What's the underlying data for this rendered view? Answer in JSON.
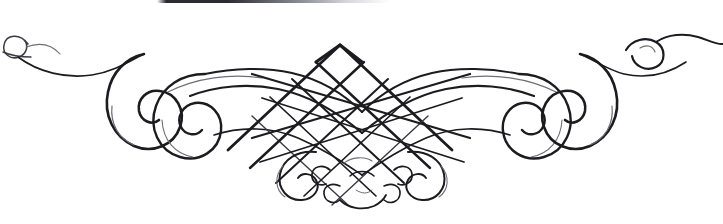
{
  "image": {
    "kind": "scanned-decorative-ornament",
    "title": "Calligraphic flourish ornament",
    "subject": "Symmetrical penwork flourish with central diagonal lattice and flanking spiral scrolls",
    "width_px": 723,
    "height_px": 224,
    "background_color": "#ffffff",
    "ink_color": "#1b1b20",
    "ink_mid_color": "#3a3a42",
    "ink_faint_color": "#6e6e77",
    "text_content": "",
    "orientation": "horizontal",
    "symmetry": "bilateral (left-right mirror about x = 362)"
  },
  "artifact": {
    "name": "scan-edge-bar",
    "description": "Dark horizontal scan artifact along top edge",
    "left_px": 157,
    "top_px": 0,
    "width_px": 233,
    "height_px": 3,
    "color_dark": "#2b2b31",
    "color_light": "#d8d8dd"
  },
  "ornament": {
    "center_x": 362,
    "parts": [
      {
        "name": "left-terminal-loop",
        "description": "Small open loop at far left terminal",
        "bbox": [
          3,
          36,
          30,
          62
        ]
      },
      {
        "name": "left-sweep",
        "description": "Long thin sweeping stroke from terminal loop inward",
        "bbox": [
          20,
          55,
          120,
          82
        ]
      },
      {
        "name": "left-outer-spiral",
        "description": "Large spiral curl, outer left",
        "bbox": [
          104,
          62,
          178,
          152
        ]
      },
      {
        "name": "left-inner-spiral",
        "description": "Second overlapping spiral curl, inner left",
        "bbox": [
          148,
          70,
          215,
          160
        ]
      },
      {
        "name": "left-arc-band",
        "description": "Broad arc sweeping from left spirals into the lattice",
        "bbox": [
          160,
          70,
          340,
          160
        ]
      },
      {
        "name": "central-lattice",
        "description": "Diagonal crosshatch diamond lattice at center, apex near top",
        "bbox": [
          250,
          44,
          480,
          180
        ],
        "apex": [
          340,
          45
        ]
      },
      {
        "name": "right-arc-band",
        "description": "Broad arc sweeping from lattice into the right spirals",
        "bbox": [
          384,
          70,
          564,
          160
        ]
      },
      {
        "name": "right-inner-spiral",
        "description": "Second overlapping spiral curl, inner right",
        "bbox": [
          509,
          70,
          576,
          160
        ]
      },
      {
        "name": "right-outer-spiral",
        "description": "Large spiral curl, outer right",
        "bbox": [
          546,
          62,
          620,
          152
        ]
      },
      {
        "name": "right-sweep",
        "description": "Long thin sweeping stroke from inner right outward to terminal",
        "bbox": [
          604,
          55,
          704,
          82
        ]
      },
      {
        "name": "right-terminal-hook",
        "description": "Hooked curl and tapering tail at far right terminal",
        "bbox": [
          624,
          33,
          723,
          68
        ]
      },
      {
        "name": "bottom-center-scrolls",
        "description": "Cluster of small scroll curls beneath the lattice",
        "bbox": [
          280,
          150,
          445,
          212
        ]
      }
    ]
  }
}
